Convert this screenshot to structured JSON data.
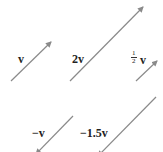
{
  "diagram": {
    "stroke_color": "#8a8a8a",
    "vectors": [
      {
        "label": "v",
        "x1": 11,
        "y1": 81,
        "x2": 51,
        "y2": 42
      },
      {
        "label": "2v",
        "x1": 70,
        "y1": 81,
        "x2": 143,
        "y2": 7
      },
      {
        "label": "1/2 v",
        "x1": 136,
        "y1": 81,
        "x2": 157,
        "y2": 61
      },
      {
        "label": "−v",
        "x1": 73,
        "y1": 116,
        "x2": 36,
        "y2": 154
      },
      {
        "label": "−1.5v",
        "x1": 156,
        "y1": 97,
        "x2": 98,
        "y2": 156
      }
    ],
    "labels": {
      "v": "v",
      "two_v": "2v",
      "half_num": "1",
      "half_den": "2",
      "half_v": "v",
      "neg_v": "−v",
      "neg_1_5v": "−1.5v"
    }
  }
}
